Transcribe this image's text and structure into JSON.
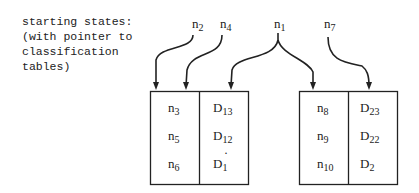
{
  "caption": "starting states:\n(with pointer to\nclassification\ntables)",
  "pointers": [
    {
      "base": "n",
      "sub": "2"
    },
    {
      "base": "n",
      "sub": "4"
    },
    {
      "base": "n",
      "sub": "1"
    },
    {
      "base": "n",
      "sub": "7"
    }
  ],
  "tables": [
    {
      "rows": [
        {
          "state": {
            "base": "n",
            "sub": "3"
          },
          "class": {
            "base": "D",
            "sub": "13"
          }
        },
        {
          "state": {
            "base": "n",
            "sub": "5"
          },
          "class": {
            "base": "D",
            "sub": "12"
          }
        },
        {
          "state": {
            "base": "n",
            "sub": "6"
          },
          "class": {
            "base": "D",
            "sub": "1",
            "mark": "·"
          }
        }
      ]
    },
    {
      "rows": [
        {
          "state": {
            "base": "n",
            "sub": "8"
          },
          "class": {
            "base": "D",
            "sub": "23"
          }
        },
        {
          "state": {
            "base": "n",
            "sub": "9"
          },
          "class": {
            "base": "D",
            "sub": "22"
          }
        },
        {
          "state": {
            "base": "n",
            "sub": "10"
          },
          "class": {
            "base": "D",
            "sub": "2"
          }
        }
      ]
    }
  ]
}
